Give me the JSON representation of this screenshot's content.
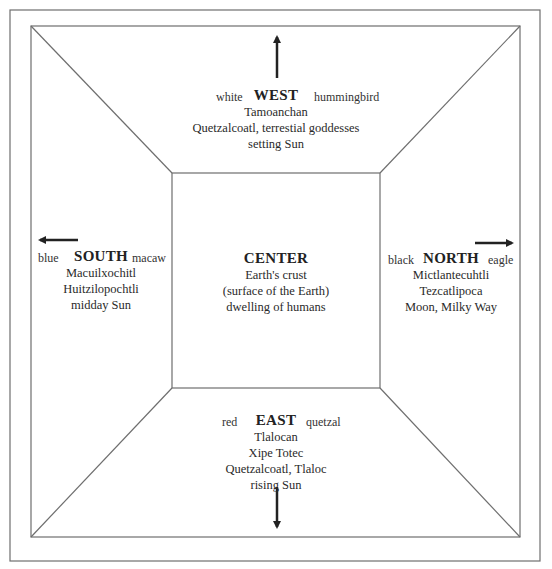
{
  "diagram": {
    "colors": {
      "line": "#6e6e6e",
      "arrow": "#222222",
      "text": "#2a2a2a"
    },
    "west": {
      "title": "WEST",
      "color": "white",
      "animal": "hummingbird",
      "lines": [
        "Tamoanchan",
        "Quetzalcoatl, terrestial goddesses",
        "setting Sun"
      ],
      "arrow": "up"
    },
    "south": {
      "title": "SOUTH",
      "color": "blue",
      "animal": "macaw",
      "lines": [
        "Macuilxochitl",
        "Huitzilopochtli",
        "midday Sun"
      ],
      "arrow": "left"
    },
    "center": {
      "title": "CENTER",
      "lines": [
        "Earth's crust",
        "(surface of the Earth)",
        "dwelling of humans"
      ]
    },
    "north": {
      "title": "NORTH",
      "color": "black",
      "animal": "eagle",
      "lines": [
        "Mictlantecuhtli",
        "Tezcatlipoca",
        "Moon, Milky Way"
      ],
      "arrow": "right"
    },
    "east": {
      "title": "EAST",
      "color": "red",
      "animal": "quetzal",
      "lines": [
        "Tlalocan",
        "Xipe Totec",
        "Quetzalcoatl, Tlaloc",
        "rising Sun"
      ],
      "arrow": "down"
    }
  }
}
